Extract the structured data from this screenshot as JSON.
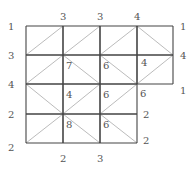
{
  "puzzle": {
    "type": "gokigen-slant-like grid with vertex clues",
    "columns_x": [
      26,
      63,
      100,
      137,
      173
    ],
    "rows_y": [
      26,
      55,
      84,
      114,
      143
    ],
    "cells": [
      {
        "r": 0,
        "c": 0,
        "d": "/"
      },
      {
        "r": 0,
        "c": 1,
        "d": "/"
      },
      {
        "r": 0,
        "c": 2,
        "d": "/"
      },
      {
        "r": 0,
        "c": 3,
        "d": "\\"
      },
      {
        "r": 1,
        "c": 0,
        "d": "/"
      },
      {
        "r": 1,
        "c": 1,
        "d": "\\"
      },
      {
        "r": 1,
        "c": 2,
        "d": "\\"
      },
      {
        "r": 1,
        "c": 3,
        "d": "/"
      },
      {
        "r": 2,
        "c": 0,
        "d": "\\"
      },
      {
        "r": 2,
        "c": 1,
        "d": "/"
      },
      {
        "r": 2,
        "c": 2,
        "d": "/"
      },
      {
        "r": 3,
        "c": 0,
        "d": "/"
      },
      {
        "r": 3,
        "c": 1,
        "d": "\\"
      },
      {
        "r": 3,
        "c": 2,
        "d": "\\"
      }
    ],
    "outer_labels": [
      {
        "text": "1",
        "x": 8,
        "y": 30
      },
      {
        "text": "3",
        "x": 60,
        "y": 20
      },
      {
        "text": "3",
        "x": 97,
        "y": 20
      },
      {
        "text": "4",
        "x": 134,
        "y": 20
      },
      {
        "text": "1",
        "x": 180,
        "y": 30
      },
      {
        "text": "3",
        "x": 8,
        "y": 59
      },
      {
        "text": "4",
        "x": 180,
        "y": 59
      },
      {
        "text": "4",
        "x": 8,
        "y": 88
      },
      {
        "text": "1",
        "x": 180,
        "y": 94
      },
      {
        "text": "2",
        "x": 8,
        "y": 118
      },
      {
        "text": "2",
        "x": 143,
        "y": 118
      },
      {
        "text": "2",
        "x": 8,
        "y": 151
      },
      {
        "text": "2",
        "x": 143,
        "y": 144
      },
      {
        "text": "2",
        "x": 60,
        "y": 162
      },
      {
        "text": "3",
        "x": 97,
        "y": 162
      }
    ],
    "inner_labels": [
      {
        "text": "7",
        "x": 66,
        "y": 69
      },
      {
        "text": "6",
        "x": 103,
        "y": 69
      },
      {
        "text": "4",
        "x": 141,
        "y": 66
      },
      {
        "text": "4",
        "x": 66,
        "y": 98
      },
      {
        "text": "6",
        "x": 103,
        "y": 98
      },
      {
        "text": "6",
        "x": 140,
        "y": 97
      },
      {
        "text": "8",
        "x": 66,
        "y": 128
      },
      {
        "text": "6",
        "x": 103,
        "y": 128
      }
    ],
    "colors": {
      "grid": "#444444",
      "diagonal": "#aaaaaa",
      "text": "#555555"
    }
  }
}
